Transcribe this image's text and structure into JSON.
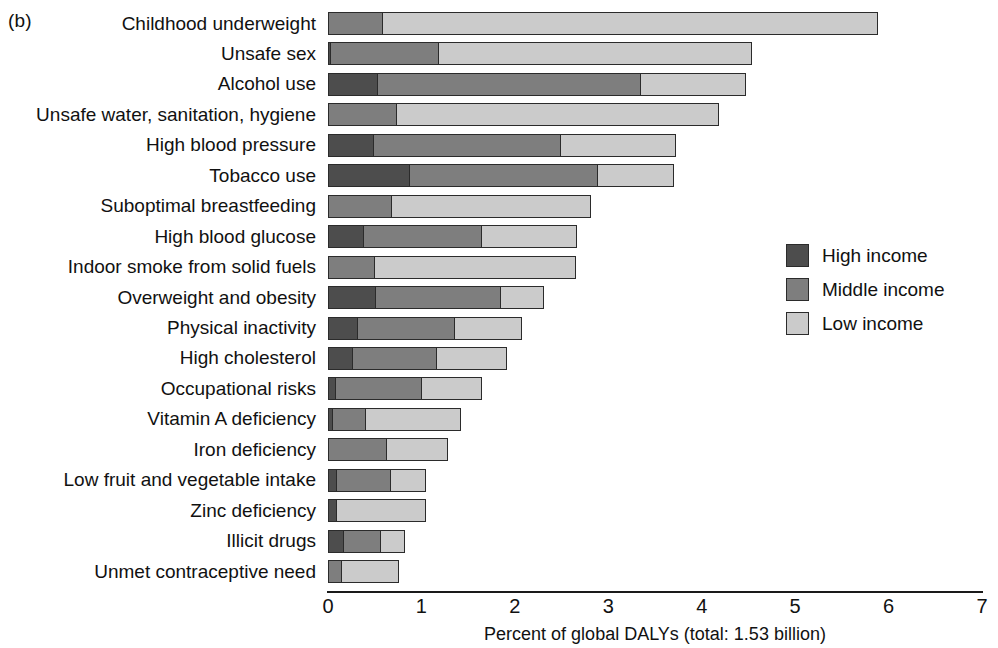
{
  "panel": {
    "label": "(b)"
  },
  "chart_data": {
    "type": "bar",
    "orientation": "horizontal",
    "stacked": true,
    "title": "",
    "xlabel": "Percent of global DALYs (total: 1.53 billion)",
    "ylabel": "",
    "xlim": [
      0,
      7
    ],
    "xticks": [
      0,
      1,
      2,
      3,
      4,
      5,
      6,
      7
    ],
    "xtick_labels": [
      "0",
      "1",
      "2",
      "3",
      "4",
      "5",
      "6",
      "7"
    ],
    "grid": false,
    "legend_position": "right",
    "legend": [
      "High income",
      "Middle income",
      "Low income"
    ],
    "colors": {
      "high": "#4d4d4d",
      "middle": "#7e7e7e",
      "low": "#cbcbcb"
    },
    "categories": [
      "Childhood underweight",
      "Unsafe sex",
      "Alcohol use",
      "Unsafe water, sanitation, hygiene",
      "High blood pressure",
      "Tobacco use",
      "Suboptimal breastfeeding",
      "High blood glucose",
      "Indoor smoke from solid fuels",
      "Overweight and obesity",
      "Physical inactivity",
      "High cholesterol",
      "Occupational risks",
      "Vitamin A deficiency",
      "Iron deficiency",
      "Low fruit and vegetable intake",
      "Zinc deficiency",
      "Illicit drugs",
      "Unmet contraceptive need"
    ],
    "series": [
      {
        "name": "High income",
        "key": "high",
        "values": [
          0.0,
          0.03,
          0.54,
          0.0,
          0.49,
          0.88,
          0.0,
          0.39,
          0.0,
          0.51,
          0.32,
          0.27,
          0.09,
          0.05,
          0.0,
          0.1,
          0.1,
          0.17,
          0.0
        ]
      },
      {
        "name": "Middle income",
        "key": "middle",
        "values": [
          0.59,
          1.17,
          2.82,
          0.74,
          2.01,
          2.02,
          0.69,
          1.27,
          0.5,
          1.35,
          1.05,
          0.91,
          0.93,
          0.37,
          0.63,
          0.58,
          0.0,
          0.41,
          0.15
        ]
      },
      {
        "name": "Low income",
        "key": "low",
        "values": [
          5.31,
          3.36,
          1.14,
          3.46,
          1.25,
          0.82,
          2.14,
          1.03,
          2.17,
          0.47,
          0.73,
          0.76,
          0.65,
          1.03,
          0.67,
          0.39,
          0.96,
          0.27,
          0.62
        ]
      }
    ],
    "totals": [
      5.9,
      4.56,
      4.5,
      4.2,
      3.75,
      3.72,
      2.83,
      2.69,
      2.67,
      2.33,
      2.1,
      1.94,
      1.67,
      1.45,
      1.3,
      1.07,
      1.06,
      0.85,
      0.77
    ]
  }
}
